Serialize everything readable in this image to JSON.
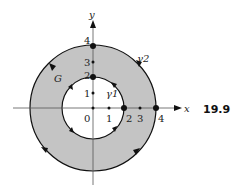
{
  "figure": {
    "number": "19.9",
    "region_label": "G",
    "inner_curve_label": "γ1",
    "outer_curve_label": "γ2",
    "axes": {
      "x_label": "x",
      "y_label": "y",
      "x_ticks": [
        "0",
        "1",
        "2",
        "3",
        "4"
      ],
      "y_ticks": [
        "1",
        "2",
        "3",
        "4"
      ]
    },
    "inner_radius": 2,
    "outer_radius": 4,
    "colors": {
      "annulus_fill": "#c4c4c4",
      "stroke": "#111111"
    }
  }
}
